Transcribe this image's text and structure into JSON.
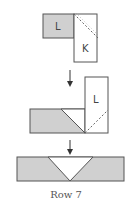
{
  "diagram": {
    "step1": {
      "square_label": "L",
      "rect_label": "K"
    },
    "step2": {
      "rect_label": "L"
    },
    "caption": "Row 7",
    "colors": {
      "fill_gray": "#d0d0d0",
      "stroke": "#555555",
      "dash": "#666666"
    }
  }
}
